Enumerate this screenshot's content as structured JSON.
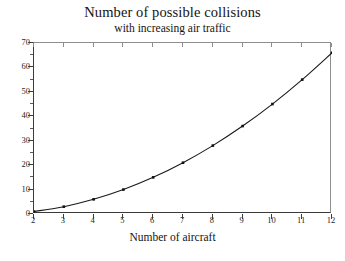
{
  "chart_data": {
    "type": "line",
    "title": "Number of possible collisions",
    "subtitle": "with increasing air traffic",
    "xlabel": "Number of aircraft",
    "ylabel": "",
    "x": [
      2,
      3,
      4,
      5,
      6,
      7,
      8,
      9,
      10,
      11,
      12
    ],
    "values": [
      1,
      3,
      6,
      10,
      15,
      21,
      28,
      36,
      45,
      55,
      66
    ],
    "series": [
      {
        "name": "possible collisions",
        "values": [
          1,
          3,
          6,
          10,
          15,
          21,
          28,
          36,
          45,
          55,
          66
        ]
      }
    ],
    "xlim": [
      2,
      12
    ],
    "ylim": [
      0,
      70
    ],
    "xticks": [
      2,
      3,
      4,
      5,
      6,
      7,
      8,
      9,
      10,
      11,
      12
    ],
    "yticks": [
      0,
      10,
      20,
      30,
      40,
      50,
      60,
      70
    ],
    "y_minor_ticks": [
      5,
      15,
      25,
      35,
      45,
      55,
      65
    ],
    "grid": false,
    "legend": false,
    "marker": "square",
    "line_color": "#1a1a1a",
    "marker_color": "#111111",
    "frame_color": "#3b3b3b",
    "background_color": "#ffffff"
  },
  "axis_labels": {
    "x_tick_labels": [
      "2",
      "3",
      "4",
      "5",
      "6",
      "7",
      "8",
      "9",
      "10",
      "11",
      "12"
    ],
    "y_tick_labels": [
      "0",
      "10",
      "20",
      "30",
      "40",
      "50",
      "60",
      "70"
    ]
  }
}
